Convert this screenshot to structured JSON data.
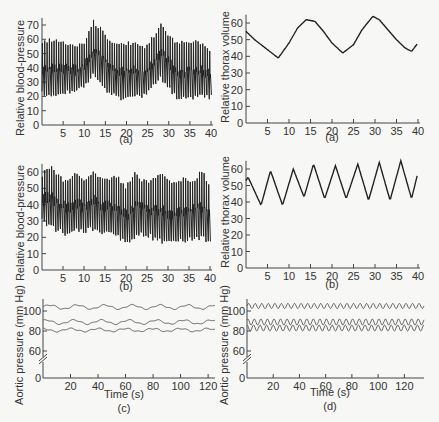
{
  "chart_data": [
    {
      "id": "left-a",
      "type": "line",
      "caption": "(a)",
      "ylabel": "Relative blood-pressure",
      "xlabel": "",
      "xlim": [
        0,
        40
      ],
      "ylim": [
        0,
        75
      ],
      "xticks": [
        5,
        10,
        15,
        20,
        25,
        30,
        35,
        40
      ],
      "yticks": [
        0,
        10,
        20,
        30,
        40,
        50,
        60,
        70
      ],
      "description": "Pulsatile blood pressure trace with beat peaks ~55-74 and troughs ~16-30; slow respiratory modulation with peaks near t=12 and t=28",
      "envelope": {
        "x": [
          0,
          2,
          4,
          6,
          8,
          10,
          12,
          14,
          16,
          18,
          20,
          22,
          24,
          26,
          28,
          30,
          32,
          34,
          36,
          38,
          40
        ],
        "upper": [
          60,
          61,
          60,
          58,
          56,
          60,
          74,
          68,
          60,
          58,
          59,
          58,
          56,
          62,
          72,
          64,
          58,
          60,
          60,
          57,
          53
        ],
        "lower": [
          20,
          20,
          20,
          21,
          21,
          26,
          34,
          28,
          20,
          17,
          18,
          20,
          18,
          25,
          32,
          24,
          16,
          17,
          18,
          20,
          16
        ]
      }
    },
    {
      "id": "right-a",
      "type": "line",
      "caption": "(a)",
      "ylabel": "Relative thorax volume",
      "xlabel": "",
      "xlim": [
        0,
        40
      ],
      "ylim": [
        0,
        65
      ],
      "xticks": [
        5,
        10,
        15,
        20,
        25,
        30,
        35,
        40
      ],
      "yticks": [
        0,
        10,
        20,
        30,
        40,
        50,
        60
      ],
      "x": [
        0,
        2,
        4,
        6,
        7.5,
        10,
        12,
        14,
        16,
        18,
        20,
        22.5,
        25,
        27,
        29.5,
        31,
        33,
        35,
        37,
        38.5,
        40
      ],
      "y": [
        55,
        50,
        46,
        42,
        39,
        48,
        57,
        62,
        61,
        55,
        48,
        42,
        47,
        56,
        64,
        62,
        56,
        50,
        45,
        43,
        48
      ]
    },
    {
      "id": "left-b",
      "type": "line",
      "caption": "(b)",
      "ylabel": "Relative blood-pressure",
      "xlabel": "",
      "xlim": [
        0,
        40
      ],
      "ylim": [
        0,
        65
      ],
      "xticks": [
        5,
        10,
        15,
        20,
        25,
        30,
        35,
        40
      ],
      "yticks": [
        0,
        10,
        20,
        30,
        40,
        50,
        60
      ],
      "description": "Pulsatile blood pressure trace with beat peaks ~50-65 and troughs ~14-30; faster respiratory modulation",
      "envelope": {
        "x": [
          0,
          2,
          4,
          6,
          8,
          10,
          12,
          14,
          16,
          18,
          20,
          22,
          24,
          26,
          28,
          30,
          32,
          34,
          36,
          38,
          40
        ],
        "upper": [
          60,
          65,
          58,
          56,
          62,
          56,
          62,
          58,
          58,
          58,
          52,
          62,
          56,
          56,
          60,
          56,
          56,
          58,
          56,
          62,
          52
        ],
        "lower": [
          28,
          25,
          22,
          20,
          22,
          22,
          24,
          22,
          20,
          18,
          15,
          18,
          20,
          18,
          16,
          15,
          16,
          16,
          18,
          18,
          14
        ]
      }
    },
    {
      "id": "right-b",
      "type": "line",
      "caption": "(b)",
      "ylabel": "Relative thorax volume",
      "xlabel": "",
      "xlim": [
        0,
        40
      ],
      "ylim": [
        0,
        65
      ],
      "xticks": [
        5,
        10,
        15,
        20,
        25,
        30,
        35,
        40
      ],
      "yticks": [
        0,
        10,
        20,
        30,
        40,
        50,
        60
      ],
      "x": [
        0,
        0.5,
        3.5,
        5.7,
        8.5,
        11,
        13.5,
        15.7,
        18.3,
        20.8,
        23.3,
        26,
        28.5,
        31,
        33.5,
        36,
        38.5,
        40
      ],
      "y": [
        53,
        55,
        38,
        59,
        38,
        60,
        43,
        63,
        42,
        62,
        42,
        63,
        41,
        64,
        41,
        65,
        42,
        58
      ]
    },
    {
      "id": "c",
      "type": "line",
      "caption": "(c)",
      "ylabel": "Aortic pressure (mm Hg)",
      "xlabel": "Time (s)",
      "xlim": [
        0,
        125
      ],
      "ylim": [
        0,
        110
      ],
      "axis_break": true,
      "xticks": [
        20,
        40,
        60,
        80,
        100,
        120
      ],
      "yticks": [
        0,
        60,
        80,
        100
      ],
      "series": [
        {
          "name": "upper",
          "mean": 104,
          "amplitude": 2,
          "period_s": 20
        },
        {
          "name": "middle",
          "mean": 89,
          "amplitude": 2,
          "period_s": 20
        },
        {
          "name": "lower",
          "mean": 81,
          "amplitude": 1.5,
          "period_s": 20
        }
      ]
    },
    {
      "id": "d",
      "type": "line",
      "caption": "(d)",
      "ylabel": "Aortic pressure (mm Hg)",
      "xlabel": "Time (s)",
      "xlim": [
        0,
        135
      ],
      "ylim": [
        0,
        110
      ],
      "axis_break": true,
      "xticks": [
        20,
        40,
        60,
        80,
        100,
        120
      ],
      "yticks": [
        0,
        60,
        80,
        100
      ],
      "series": [
        {
          "name": "upper",
          "mean": 105,
          "amplitude": 2.5,
          "period_s": 5
        },
        {
          "name": "middle",
          "mean": 89,
          "amplitude": 3,
          "period_s": 5
        },
        {
          "name": "lower",
          "mean": 83,
          "amplitude": 3,
          "period_s": 5
        }
      ]
    }
  ],
  "labels": {
    "left_a": {
      "ylabel": "Relative blood-pressure",
      "caption": "(a)"
    },
    "right_a": {
      "ylabel": "Relative thorax volume",
      "caption": "(a)"
    },
    "left_b": {
      "ylabel": "Relative blood-pressure",
      "caption": "(b)"
    },
    "right_b": {
      "ylabel": "Relative thorax volume",
      "caption": "(b)"
    },
    "c": {
      "ylabel": "Aortic pressure (mm Hg)",
      "xlabel": "Time (s)",
      "caption": "(c)"
    },
    "d": {
      "ylabel": "Aortic pressure (mm Hg)",
      "xlabel": "Time (s)",
      "caption": "(d)"
    }
  }
}
